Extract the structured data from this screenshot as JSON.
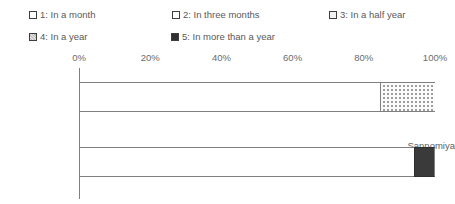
{
  "chart_data": {
    "type": "bar",
    "orientation": "horizontal",
    "stacked": true,
    "stacked_100": true,
    "title": "",
    "xlabel": "",
    "ylabel": "",
    "xlim": [
      0,
      100
    ],
    "xticks": [
      "0%",
      "20%",
      "40%",
      "60%",
      "80%",
      "100%"
    ],
    "xtick_values": [
      0,
      20,
      40,
      60,
      80,
      100
    ],
    "grid": false,
    "legend_position": "top",
    "categories": [
      "Sannomiya",
      "Asago"
    ],
    "series": [
      {
        "name": "1: In a month",
        "values": [
          84.5,
          94.0
        ],
        "fill": "empty"
      },
      {
        "name": "2: In three months",
        "values": [
          15.5,
          0.0
        ],
        "fill": "dots"
      },
      {
        "name": "3: In a half year",
        "values": [
          0.0,
          0.0
        ],
        "fill": "light"
      },
      {
        "name": "4: In a year",
        "values": [
          0.0,
          0.0
        ],
        "fill": "medium"
      },
      {
        "name": "5: In more than a year",
        "values": [
          0.0,
          6.0
        ],
        "fill": "dark"
      }
    ]
  },
  "legend": {
    "items": [
      {
        "label": "1: In a month",
        "swatch": "empty-square-icon"
      },
      {
        "label": "2: In three months",
        "swatch": "dotted-square-icon"
      },
      {
        "label": "3: In a half year",
        "swatch": "light-square-icon"
      },
      {
        "label": "4: In a year",
        "swatch": "gray-square-icon"
      },
      {
        "label": "5: In more than a year",
        "swatch": "dark-square-icon"
      }
    ]
  },
  "axis": {
    "x_ticks": [
      "0%",
      "20%",
      "40%",
      "60%",
      "80%",
      "100%"
    ],
    "y_categories": [
      "Sannomiya",
      "Asago"
    ]
  },
  "colors": {
    "axis_line": "#7f7f7f",
    "text": "#5a5a5a",
    "bar_border": "#7f7f7f",
    "series_dark": "#3a3a3a",
    "series_medium": "#bdbdbd",
    "series_light": "#f3f3f3",
    "series_empty": "#ffffff"
  }
}
